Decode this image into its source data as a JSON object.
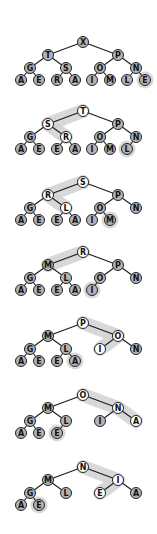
{
  "diagram": {
    "title": "",
    "node_fill": "#b4b4b4",
    "node_highlight_fill": "#ffffff",
    "node_stroke": "#222222",
    "edge_color": "#1a1a1a",
    "highlight_band": "#d4d4d4",
    "layout": {
      "level_x": [
        [
          83
        ],
        [
          48,
          118
        ],
        [
          30,
          66,
          100,
          136
        ],
        [
          21,
          39,
          57,
          75,
          92,
          110,
          127,
          145
        ]
      ],
      "level_dy": [
        0,
        13,
        26,
        38
      ],
      "radius": 5.5
    },
    "trees": [
      {
        "name": "step-1",
        "root_y": 42,
        "nodes": [
          "X",
          "T",
          "P",
          "G",
          "S",
          "O",
          "N",
          "A",
          "E",
          "R",
          "A",
          "I",
          "M",
          "L",
          "E"
        ],
        "highlight_path": [],
        "highlight_nodes": [
          14
        ],
        "white_nodes": []
      },
      {
        "name": "step-2",
        "root_y": 111,
        "nodes": [
          "T",
          "S",
          "P",
          "G",
          "R",
          "O",
          "N",
          "A",
          "E",
          "E",
          "A",
          "I",
          "M",
          "L"
        ],
        "highlight_path": [
          0,
          1,
          4
        ],
        "highlight_nodes": [
          13
        ],
        "white_nodes": [
          0,
          1,
          4
        ]
      },
      {
        "name": "step-3",
        "root_y": 182,
        "nodes": [
          "S",
          "R",
          "P",
          "G",
          "L",
          "O",
          "N",
          "A",
          "E",
          "E",
          "A",
          "I",
          "M"
        ],
        "highlight_path": [
          0,
          1,
          4
        ],
        "highlight_nodes": [
          12
        ],
        "white_nodes": [
          0,
          1,
          4
        ]
      },
      {
        "name": "step-4",
        "root_y": 252,
        "nodes": [
          "R",
          "M",
          "P",
          "G",
          "L",
          "O",
          "N",
          "A",
          "E",
          "E",
          "A",
          "I"
        ],
        "highlight_path": [
          0,
          1
        ],
        "highlight_nodes": [
          11
        ],
        "white_nodes": [
          0
        ]
      },
      {
        "name": "step-5",
        "root_y": 323,
        "nodes": [
          "P",
          "M",
          "O",
          "G",
          "L",
          "I",
          "N",
          "A",
          "E",
          "E",
          "A"
        ],
        "highlight_path": [
          0,
          2,
          5
        ],
        "highlight_nodes": [
          10
        ],
        "white_nodes": [
          0,
          2,
          5
        ]
      },
      {
        "name": "step-6",
        "root_y": 395,
        "nodes": [
          "O",
          "M",
          "N",
          "G",
          "L",
          "I",
          "A",
          "A",
          "E",
          "E"
        ],
        "highlight_path": [
          0,
          2,
          6
        ],
        "highlight_nodes": [
          9
        ],
        "white_nodes": [
          0,
          2,
          6
        ]
      },
      {
        "name": "step-7",
        "root_y": 467,
        "nodes": [
          "N",
          "M",
          "I",
          "G",
          "L",
          "E",
          "A",
          "A",
          "E"
        ],
        "highlight_path": [
          0,
          2,
          5
        ],
        "highlight_nodes": [
          8
        ],
        "white_nodes": [
          0,
          2,
          5
        ]
      }
    ]
  }
}
